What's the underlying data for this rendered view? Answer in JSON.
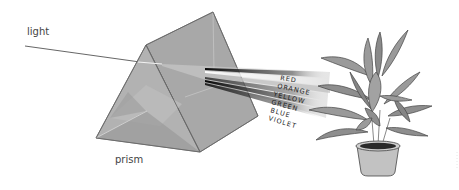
{
  "labels": {
    "light": "light",
    "prism": "prism"
  },
  "spectrum": [
    {
      "name": "RED"
    },
    {
      "name": "ORANGE"
    },
    {
      "name": "YELLOW"
    },
    {
      "name": "GREEN"
    },
    {
      "name": "BLUE"
    },
    {
      "name": "VIOLET"
    }
  ],
  "colors": {
    "prism_face_light": "#b4b4b4",
    "prism_face_mid": "#a2a2a2",
    "prism_face_dark": "#8c8c8c",
    "plant_leaf": "#9a9a9a",
    "plant_leaf_dark": "#7d7d7d",
    "pot": "#c2c2c2",
    "soil": "#2a2a2a"
  }
}
